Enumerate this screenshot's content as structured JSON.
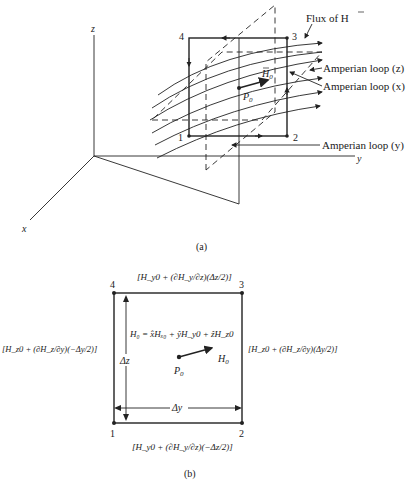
{
  "figure_a": {
    "caption": "(a)",
    "axes": {
      "x": "x",
      "y": "y",
      "z": "z"
    },
    "corners": [
      "1",
      "2",
      "3",
      "4"
    ],
    "point_label": "P",
    "point_sub": "0",
    "vector_label": "H",
    "vector_sub": "0",
    "annotations": {
      "flux": "Flux of H",
      "loop_z": "Amperian loop (z)",
      "loop_x": "Amperian loop (x)",
      "loop_y": "Amperian loop (y)"
    }
  },
  "figure_b": {
    "caption": "(b)",
    "corners": [
      "1",
      "2",
      "3",
      "4"
    ],
    "point_label": "P",
    "point_sub": "0",
    "vector_label": "H",
    "vector_sub": "0",
    "equation": "H₀ = x̂Hₓ₀ + ŷH_y0 + ẑH_z0",
    "delta_z": "Δz",
    "delta_y": "Δy",
    "edges": {
      "top": "[H_y0 + (∂H_y/∂z)(Δz/2)]",
      "bottom": "[H_y0 + (∂H_y/∂z)(−Δz/2)]",
      "left": "[H_z0 + (∂H_z/∂y)(−Δy/2)]",
      "right": "[H_z0 + (∂H_z/∂y)(Δy/2)]"
    }
  }
}
